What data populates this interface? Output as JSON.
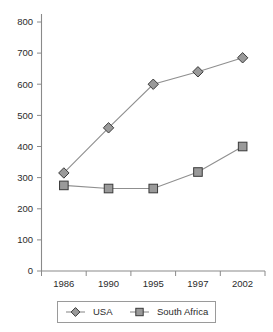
{
  "chart_data": {
    "type": "line",
    "title": "",
    "subtitle": "",
    "xlabel": "",
    "ylabel": "",
    "categories": [
      "1986",
      "1990",
      "1995",
      "1997",
      "2002"
    ],
    "series": [
      {
        "name": "USA",
        "marker": "diamond",
        "values": [
          315,
          460,
          600,
          640,
          685
        ]
      },
      {
        "name": "South Africa",
        "marker": "square",
        "values": [
          275,
          265,
          265,
          318,
          400
        ]
      }
    ],
    "ylim": [
      0,
      800
    ],
    "yticks": [
      0,
      100,
      200,
      300,
      400,
      500,
      600,
      700,
      800
    ],
    "ytick_labels": [
      "0",
      "100",
      "200",
      "300",
      "400",
      "500",
      "600",
      "700",
      "800"
    ],
    "xtick_labels": [
      "1986",
      "1990",
      "1995",
      "1997",
      "2002"
    ],
    "grid": false,
    "legend_position": "bottom",
    "legend_entries": [
      "USA",
      "South Africa"
    ],
    "annotations": [],
    "colors": {
      "series_line": "#8f8f8f",
      "marker_fill": "#9a9a9a",
      "marker_edge": "#3a3a3a",
      "axis": "#8a8a8a",
      "text": "#2b2b2b",
      "legend_border": "#9a9a9a",
      "background": "#ffffff"
    }
  },
  "axis": {
    "y_tick_0": "0",
    "y_tick_1": "100",
    "y_tick_2": "200",
    "y_tick_3": "300",
    "y_tick_4": "400",
    "y_tick_5": "500",
    "y_tick_6": "600",
    "y_tick_7": "700",
    "y_tick_8": "800",
    "x_tick_0": "1986",
    "x_tick_1": "1990",
    "x_tick_2": "1995",
    "x_tick_3": "1997",
    "x_tick_4": "2002"
  },
  "legend": {
    "entry_0_label": "USA",
    "entry_1_label": "South Africa"
  }
}
